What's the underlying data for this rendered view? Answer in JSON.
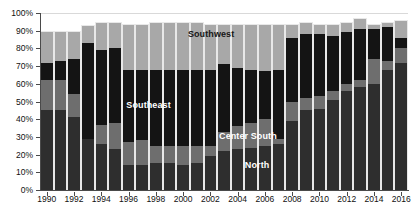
{
  "chart_data": {
    "type": "bar",
    "subtype": "stacked-percentage-column",
    "title": "",
    "subtitle": "",
    "xlabel": "",
    "ylabel": "",
    "ylim": [
      0,
      100
    ],
    "yunit": "%",
    "ytick_labels": [
      "0%",
      "10%",
      "20%",
      "30%",
      "40%",
      "50%",
      "60%",
      "70%",
      "80%",
      "90%",
      "100%"
    ],
    "ytick_values": [
      0,
      10,
      20,
      30,
      40,
      50,
      60,
      70,
      80,
      90,
      100
    ],
    "grid": true,
    "grid_axis": "y",
    "legend_position": "inline-annotations",
    "categories": [
      "1990",
      "1991",
      "1992",
      "1993",
      "1994",
      "1995",
      "1996",
      "1997",
      "1998",
      "1999",
      "2000",
      "2001",
      "2002",
      "2003",
      "2004",
      "2005",
      "2006",
      "2007",
      "2008",
      "2009",
      "2010",
      "2011",
      "2012",
      "2013",
      "2014",
      "2015",
      "2016"
    ],
    "xtick_labels": [
      "1990",
      "1992",
      "1994",
      "1996",
      "1998",
      "2000",
      "2002",
      "2004",
      "2006",
      "2008",
      "2010",
      "2012",
      "2014",
      "2016"
    ],
    "series": [
      {
        "name": "North",
        "color": "#2e2e2e",
        "values": [
          45,
          45,
          41,
          29,
          26,
          23,
          14,
          14,
          15,
          15,
          14,
          15,
          19,
          22,
          23,
          24,
          25,
          26,
          39,
          45,
          46,
          51,
          56,
          58,
          60,
          68,
          72
        ]
      },
      {
        "name": "Center South",
        "color": "#6e6e6e",
        "values": [
          17,
          17,
          13,
          0,
          11,
          15,
          13,
          14,
          10,
          10,
          11,
          10,
          6,
          11,
          13,
          14,
          15,
          3,
          11,
          7,
          7,
          5,
          4,
          4,
          14,
          5,
          8
        ]
      },
      {
        "name": "Southeast",
        "color": "#141414",
        "values": [
          10,
          11,
          20,
          54,
          42,
          42,
          41,
          40,
          43,
          43,
          43,
          43,
          43,
          38,
          33,
          30,
          27,
          39,
          36,
          36,
          35,
          31,
          29,
          29,
          17,
          19,
          6
        ]
      },
      {
        "name": "Southwest",
        "color": "#a8a8a8",
        "values": [
          18,
          17,
          16,
          10,
          16,
          15,
          26,
          26,
          27,
          27,
          27,
          27,
          26,
          23,
          25,
          26,
          27,
          26,
          8,
          7,
          6,
          7,
          6,
          6,
          3,
          3,
          10
        ]
      }
    ],
    "annotations": [
      {
        "text": "Southwest",
        "series": "Southwest",
        "color": "#161616",
        "x_pct": 46.5,
        "y_pct": 88.0
      },
      {
        "text": "Southeast",
        "series": "Southeast",
        "color": "#ffffff",
        "x_pct": 29.5,
        "y_pct": 48.0
      },
      {
        "text": "Center South",
        "series": "Center South",
        "color": "#ffffff",
        "x_pct": 56.5,
        "y_pct": 30.5
      },
      {
        "text": "North",
        "series": "North",
        "color": "#ffffff",
        "x_pct": 59.0,
        "y_pct": 14.0
      }
    ]
  }
}
